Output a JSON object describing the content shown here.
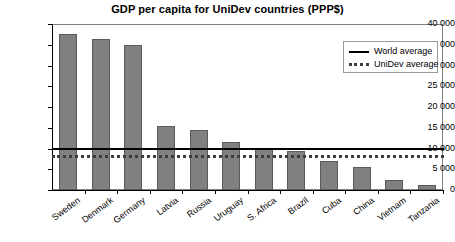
{
  "chart_data": {
    "type": "bar",
    "title": "GDP per capita for UniDev countries (PPP$)",
    "xlabel": "",
    "ylabel": "",
    "categories": [
      "Sweden",
      "Denmark",
      "Germany",
      "Latvia",
      "Russia",
      "Uruguay",
      "S. Africa",
      "Brazil",
      "Cuba",
      "China",
      "Vietnam",
      "Tanzania"
    ],
    "values": [
      37500,
      36500,
      35000,
      15500,
      14500,
      11500,
      10000,
      9500,
      7000,
      5500,
      2500,
      1300
    ],
    "ylim": [
      0,
      40000
    ],
    "ytick_values": [
      0,
      5000,
      10000,
      15000,
      20000,
      25000,
      30000,
      35000,
      40000
    ],
    "ytick_labels": [
      "0",
      "5 000",
      "10 000",
      "15 000",
      "20 000",
      "25 000",
      "30 000",
      "35 000",
      "40 000"
    ],
    "grid": false,
    "legend_position": "upper right",
    "series_color": "#808080",
    "reference_lines": [
      {
        "name": "World average",
        "value": 10200,
        "style": "solid",
        "color": "#000000"
      },
      {
        "name": "UniDev average",
        "value": 8500,
        "style": "dotted",
        "color": "#3c3c3c"
      }
    ],
    "legend": [
      {
        "label": "World average",
        "style": "solid"
      },
      {
        "label": "UniDev average",
        "style": "dotted"
      }
    ]
  }
}
